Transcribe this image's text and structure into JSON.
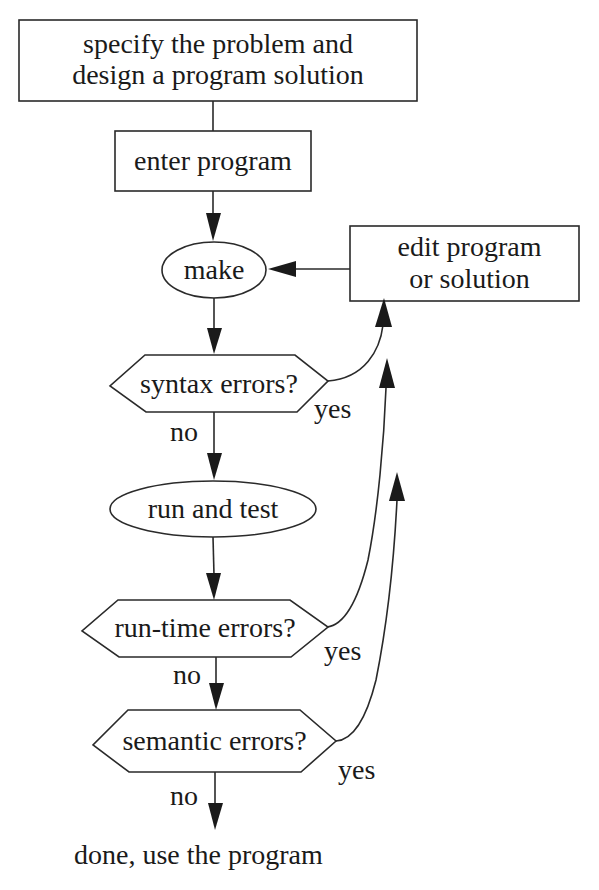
{
  "diagram": {
    "type": "flowchart",
    "nodes": {
      "specify": {
        "line1": "specify the problem and",
        "line2": "design a program solution",
        "shape": "rectangle"
      },
      "enter": {
        "label": "enter program",
        "shape": "rectangle"
      },
      "make": {
        "label": "make",
        "shape": "ellipse"
      },
      "edit": {
        "line1": "edit program",
        "line2": "or solution",
        "shape": "rectangle"
      },
      "syntax": {
        "label": "syntax errors?",
        "shape": "hexagon"
      },
      "run": {
        "label": "run and test",
        "shape": "ellipse"
      },
      "runtime": {
        "label": "run-time errors?",
        "shape": "hexagon"
      },
      "semantic": {
        "label": "semantic errors?",
        "shape": "hexagon"
      },
      "done": {
        "label": "done, use the program",
        "shape": "text"
      }
    },
    "edge_labels": {
      "syntax_no": "no",
      "syntax_yes": "yes",
      "runtime_no": "no",
      "runtime_yes": "yes",
      "semantic_no": "no",
      "semantic_yes": "yes"
    },
    "edges": [
      {
        "from": "specify",
        "to": "enter",
        "label": ""
      },
      {
        "from": "enter",
        "to": "make",
        "label": ""
      },
      {
        "from": "edit",
        "to": "make",
        "label": ""
      },
      {
        "from": "make",
        "to": "syntax",
        "label": ""
      },
      {
        "from": "syntax",
        "to": "run",
        "label": "no"
      },
      {
        "from": "syntax",
        "to": "edit",
        "label": "yes"
      },
      {
        "from": "run",
        "to": "runtime",
        "label": ""
      },
      {
        "from": "runtime",
        "to": "semantic",
        "label": "no"
      },
      {
        "from": "runtime",
        "to": "edit",
        "label": "yes"
      },
      {
        "from": "semantic",
        "to": "done",
        "label": "no"
      },
      {
        "from": "semantic",
        "to": "edit",
        "label": "yes"
      }
    ],
    "line_color": "#2a2a2a"
  }
}
